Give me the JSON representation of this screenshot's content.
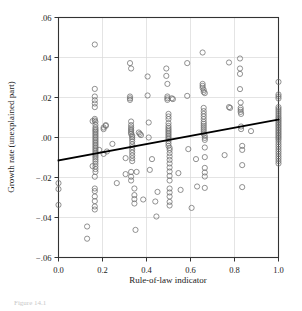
{
  "figure": {
    "caption_partial": "Figure 14.1",
    "background": "#ffffff"
  },
  "chart_data": {
    "type": "scatter",
    "title": "",
    "xlabel": "Rule-of-law indicator",
    "ylabel": "Growth rate (unexplained part)",
    "xlim": [
      0.0,
      1.0
    ],
    "ylim": [
      -0.06,
      0.06
    ],
    "xticks": [
      0.0,
      0.2,
      0.4,
      0.6,
      0.8,
      1.0
    ],
    "xtick_labels": [
      "0.0",
      "0.2",
      "0.4",
      "0.6",
      "0.8",
      "1.0"
    ],
    "yticks": [
      0.06,
      0.04,
      0.02,
      0.0,
      -0.02,
      -0.04,
      -0.06
    ],
    "ytick_labels": [
      ".06",
      ".04",
      ".02",
      ".00",
      "−.02",
      "−.04",
      "−.06"
    ],
    "grid": true,
    "grid_color": "#d8d8d8",
    "legend": null,
    "marker": "open-circle",
    "marker_color": "#6e6e6e",
    "marker_radius_px": 2.6,
    "fit_line": {
      "type": "linear-regression",
      "color": "#000000",
      "width_px": 1.8,
      "x0": 0.0,
      "y0": -0.0115,
      "x1": 1.0,
      "y1": 0.009,
      "slope": 0.0205,
      "intercept": -0.0115
    },
    "points": [
      [
        0.0,
        -0.0228
      ],
      [
        0.0,
        -0.0258
      ],
      [
        0.0,
        -0.0337
      ],
      [
        0.13,
        -0.0445
      ],
      [
        0.13,
        -0.0506
      ],
      [
        0.165,
        0.0465
      ],
      [
        0.165,
        0.0243
      ],
      [
        0.165,
        0.0205
      ],
      [
        0.165,
        0.0186
      ],
      [
        0.165,
        0.017
      ],
      [
        0.165,
        0.0152
      ],
      [
        0.165,
        0.0093
      ],
      [
        0.165,
        0.0085
      ],
      [
        0.168,
        0.0078
      ],
      [
        0.168,
        0.0063
      ],
      [
        0.168,
        0.005
      ],
      [
        0.168,
        0.0042
      ],
      [
        0.168,
        0.0035
      ],
      [
        0.168,
        0.0028
      ],
      [
        0.168,
        0.002
      ],
      [
        0.168,
        0.0012
      ],
      [
        0.168,
        0.0004
      ],
      [
        0.168,
        -0.0004
      ],
      [
        0.168,
        -0.0012
      ],
      [
        0.168,
        -0.002
      ],
      [
        0.168,
        -0.0028
      ],
      [
        0.168,
        -0.0036
      ],
      [
        0.168,
        -0.0044
      ],
      [
        0.168,
        -0.0052
      ],
      [
        0.168,
        -0.006
      ],
      [
        0.168,
        -0.0068
      ],
      [
        0.168,
        -0.0076
      ],
      [
        0.168,
        -0.0084
      ],
      [
        0.168,
        -0.0092
      ],
      [
        0.168,
        -0.01
      ],
      [
        0.168,
        -0.011
      ],
      [
        0.168,
        -0.012
      ],
      [
        0.168,
        -0.0132
      ],
      [
        0.168,
        -0.0145
      ],
      [
        0.168,
        -0.0158
      ],
      [
        0.168,
        -0.0172
      ],
      [
        0.165,
        -0.0196
      ],
      [
        0.165,
        -0.0255
      ],
      [
        0.165,
        -0.0268
      ],
      [
        0.165,
        -0.0295
      ],
      [
        0.165,
        -0.0318
      ],
      [
        0.165,
        -0.0345
      ],
      [
        0.165,
        -0.036
      ],
      [
        0.155,
        0.0082
      ],
      [
        0.155,
        -0.0143
      ],
      [
        0.185,
        -0.0062
      ],
      [
        0.205,
        0.0042
      ],
      [
        0.205,
        0.005
      ],
      [
        0.215,
        0.0058
      ],
      [
        0.215,
        0.0062
      ],
      [
        0.205,
        -0.0082
      ],
      [
        0.22,
        -0.007
      ],
      [
        0.245,
        -0.0032
      ],
      [
        0.265,
        -0.0228
      ],
      [
        0.305,
        -0.0103
      ],
      [
        0.305,
        -0.0183
      ],
      [
        0.325,
        0.0372
      ],
      [
        0.325,
        0.0205
      ],
      [
        0.325,
        0.0196
      ],
      [
        0.325,
        0.0188
      ],
      [
        0.33,
        0.0345
      ],
      [
        0.33,
        0.008
      ],
      [
        0.33,
        0.0062
      ],
      [
        0.33,
        0.005
      ],
      [
        0.33,
        0.0042
      ],
      [
        0.33,
        0.0034
      ],
      [
        0.33,
        0.0026
      ],
      [
        0.33,
        0.0018
      ],
      [
        0.335,
        0.001
      ],
      [
        0.335,
        0.0002
      ],
      [
        0.335,
        -0.0008
      ],
      [
        0.335,
        -0.002
      ],
      [
        0.335,
        -0.0034
      ],
      [
        0.335,
        -0.0048
      ],
      [
        0.335,
        -0.0062
      ],
      [
        0.335,
        -0.0076
      ],
      [
        0.335,
        -0.009
      ],
      [
        0.335,
        -0.0104
      ],
      [
        0.335,
        -0.0118
      ],
      [
        0.33,
        -0.0172
      ],
      [
        0.33,
        -0.0196
      ],
      [
        0.33,
        -0.0215
      ],
      [
        0.345,
        -0.0255
      ],
      [
        0.345,
        -0.0288
      ],
      [
        0.345,
        -0.0308
      ],
      [
        0.345,
        -0.033
      ],
      [
        0.35,
        -0.0462
      ],
      [
        0.355,
        -0.0172
      ],
      [
        0.365,
        0.0025
      ],
      [
        0.37,
        0.0018
      ],
      [
        0.375,
        0.0012
      ],
      [
        0.385,
        -0.031
      ],
      [
        0.405,
        0.0305
      ],
      [
        0.405,
        0.021
      ],
      [
        0.41,
        0.0075
      ],
      [
        0.41,
        0.0
      ],
      [
        0.415,
        -0.0162
      ],
      [
        0.425,
        -0.0108
      ],
      [
        0.44,
        -0.032
      ],
      [
        0.445,
        -0.0395
      ],
      [
        0.45,
        -0.0272
      ],
      [
        0.49,
        0.0345
      ],
      [
        0.49,
        0.0308
      ],
      [
        0.495,
        0.0268
      ],
      [
        0.495,
        0.0205
      ],
      [
        0.495,
        0.0196
      ],
      [
        0.495,
        0.0188
      ],
      [
        0.5,
        0.0118
      ],
      [
        0.5,
        0.0105
      ],
      [
        0.5,
        0.0092
      ],
      [
        0.5,
        0.0072
      ],
      [
        0.5,
        0.0058
      ],
      [
        0.5,
        0.0048
      ],
      [
        0.5,
        0.004
      ],
      [
        0.5,
        0.0032
      ],
      [
        0.5,
        0.0024
      ],
      [
        0.5,
        0.0016
      ],
      [
        0.5,
        0.0008
      ],
      [
        0.5,
        0.0
      ],
      [
        0.5,
        -0.0008
      ],
      [
        0.5,
        -0.0018
      ],
      [
        0.5,
        -0.003
      ],
      [
        0.5,
        -0.0042
      ],
      [
        0.505,
        -0.0052
      ],
      [
        0.505,
        -0.0062
      ],
      [
        0.505,
        -0.0078
      ],
      [
        0.505,
        -0.0095
      ],
      [
        0.505,
        -0.0112
      ],
      [
        0.505,
        -0.013
      ],
      [
        0.505,
        -0.015
      ],
      [
        0.505,
        -0.017
      ],
      [
        0.505,
        -0.0192
      ],
      [
        0.505,
        -0.0215
      ],
      [
        0.505,
        -0.0255
      ],
      [
        0.505,
        -0.0275
      ],
      [
        0.505,
        -0.0295
      ],
      [
        0.505,
        -0.0322
      ],
      [
        0.505,
        -0.034
      ],
      [
        0.515,
        0.0196
      ],
      [
        0.52,
        0.0192
      ],
      [
        0.545,
        -0.0178
      ],
      [
        0.555,
        -0.0262
      ],
      [
        0.585,
        0.0372
      ],
      [
        0.585,
        0.0208
      ],
      [
        0.59,
        -0.0058
      ],
      [
        0.605,
        -0.0352
      ],
      [
        0.625,
        -0.0108
      ],
      [
        0.63,
        -0.0245
      ],
      [
        0.655,
        0.0425
      ],
      [
        0.655,
        0.0268
      ],
      [
        0.655,
        0.0258
      ],
      [
        0.655,
        0.0248
      ],
      [
        0.66,
        0.0238
      ],
      [
        0.66,
        0.0228
      ],
      [
        0.665,
        0.0222
      ],
      [
        0.66,
        0.0148
      ],
      [
        0.66,
        0.0132
      ],
      [
        0.66,
        0.0118
      ],
      [
        0.66,
        0.0105
      ],
      [
        0.66,
        0.0092
      ],
      [
        0.66,
        0.0078
      ],
      [
        0.66,
        0.0068
      ],
      [
        0.66,
        0.0058
      ],
      [
        0.66,
        0.0048
      ],
      [
        0.66,
        0.0038
      ],
      [
        0.66,
        0.0028
      ],
      [
        0.66,
        0.0018
      ],
      [
        0.665,
        0.0008
      ],
      [
        0.665,
        -0.0002
      ],
      [
        0.665,
        -0.0012
      ],
      [
        0.665,
        -0.005
      ],
      [
        0.665,
        -0.0098
      ],
      [
        0.665,
        -0.0152
      ],
      [
        0.665,
        -0.0175
      ],
      [
        0.665,
        -0.0195
      ],
      [
        0.665,
        -0.0252
      ],
      [
        0.755,
        -0.0088
      ],
      [
        0.775,
        0.0375
      ],
      [
        0.775,
        0.0152
      ],
      [
        0.78,
        0.0148
      ],
      [
        0.825,
        0.0395
      ],
      [
        0.825,
        0.0345
      ],
      [
        0.825,
        0.0318
      ],
      [
        0.825,
        0.0242
      ],
      [
        0.828,
        0.0175
      ],
      [
        0.828,
        0.0148
      ],
      [
        0.828,
        0.0138
      ],
      [
        0.828,
        0.0128
      ],
      [
        0.83,
        0.0118
      ],
      [
        0.83,
        0.0055
      ],
      [
        0.83,
        0.0042
      ],
      [
        0.835,
        -0.0042
      ],
      [
        0.835,
        -0.0062
      ],
      [
        0.835,
        -0.0138
      ],
      [
        0.835,
        -0.0248
      ],
      [
        0.875,
        0.0032
      ],
      [
        1.0,
        0.0278
      ],
      [
        1.0,
        0.0215
      ],
      [
        1.0,
        0.0205
      ],
      [
        1.0,
        0.0195
      ],
      [
        1.0,
        0.0152
      ],
      [
        1.0,
        0.0142
      ],
      [
        1.0,
        0.0132
      ],
      [
        1.0,
        0.0122
      ],
      [
        1.0,
        0.0112
      ],
      [
        1.0,
        0.0102
      ],
      [
        1.0,
        0.0094
      ],
      [
        1.0,
        0.0086
      ],
      [
        1.0,
        0.0078
      ],
      [
        1.0,
        0.007
      ],
      [
        1.0,
        0.0062
      ],
      [
        1.0,
        0.0054
      ],
      [
        1.0,
        0.0046
      ],
      [
        1.0,
        0.0038
      ],
      [
        1.0,
        0.003
      ],
      [
        1.0,
        0.0022
      ],
      [
        1.0,
        0.0014
      ],
      [
        1.0,
        0.0006
      ],
      [
        1.0,
        -0.0002
      ],
      [
        1.0,
        -0.001
      ],
      [
        1.0,
        -0.0022
      ],
      [
        1.0,
        -0.0034
      ],
      [
        1.0,
        -0.0046
      ],
      [
        1.0,
        -0.0058
      ],
      [
        1.0,
        -0.007
      ],
      [
        1.0,
        -0.0082
      ],
      [
        1.0,
        -0.0094
      ],
      [
        1.0,
        -0.0106
      ],
      [
        1.0,
        -0.0118
      ],
      [
        1.0,
        -0.013
      ]
    ]
  }
}
